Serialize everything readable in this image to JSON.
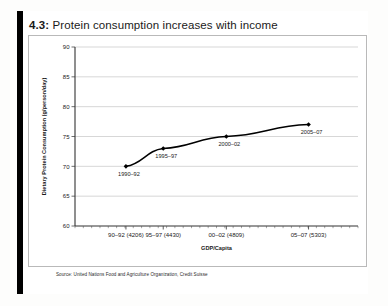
{
  "figure": {
    "number": "4.3:",
    "title": "Protein consumption increases with income",
    "source": "Source: United Nations Food and Agriculture Organization, Credit Suisse"
  },
  "chart_data": {
    "type": "line",
    "title": "Protein consumption increases with income",
    "xlabel": "GDP/Capita",
    "ylabel": "Dietary Protein Consumption (g/person/day)",
    "xlim": [
      3900,
      5600
    ],
    "ylim": [
      60,
      90
    ],
    "yticks": [
      60,
      65,
      70,
      75,
      80,
      85,
      90
    ],
    "ytick_labels": [
      "60",
      "65",
      "70",
      "75",
      "80",
      "85",
      "90"
    ],
    "grid": true,
    "legend": "none",
    "xticks": [
      4206,
      4430,
      4809,
      5303
    ],
    "xtick_labels": [
      "90–92 (4206)",
      "95–97 (4430)",
      "00–02 (4809)",
      "05–07 (5303)"
    ],
    "series": [
      {
        "name": "Dietary protein consumption",
        "color": "#000000",
        "marker": "diamond",
        "points": [
          {
            "label": "1990–92",
            "x": 4206,
            "y": 70.0
          },
          {
            "label": "1995–97",
            "x": 4430,
            "y": 73.0
          },
          {
            "label": "2000–02",
            "x": 4809,
            "y": 75.0
          },
          {
            "label": "2005–07",
            "x": 5303,
            "y": 77.0
          }
        ]
      }
    ]
  },
  "colors": {
    "line": "#000000",
    "grid": "#bcbcbc",
    "axis": "#4a4a4a",
    "frame": "#b9b9b9",
    "accent": "#000000"
  }
}
